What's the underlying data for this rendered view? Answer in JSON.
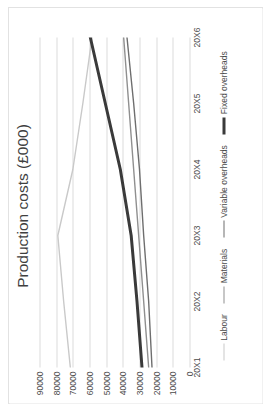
{
  "chart_data": {
    "type": "line",
    "title": "Production costs (£000)",
    "xlabel": "",
    "ylabel": "",
    "categories": [
      "20X1",
      "20X2",
      "20X3",
      "20X4",
      "20X5",
      "20X6"
    ],
    "ylim": [
      0,
      90000
    ],
    "yticks": [
      0,
      10000,
      20000,
      30000,
      40000,
      50000,
      60000,
      70000,
      80000,
      90000
    ],
    "ytick_labels": [
      "0",
      "10000",
      "20000",
      "30000",
      "40000",
      "50000",
      "60000",
      "70000",
      "80000",
      "90000"
    ],
    "grid": "vertical-gridlines-at-y-ticks",
    "legend_position": "bottom",
    "rotation": "chart rotated 90 degrees counter-clockwise",
    "series": [
      {
        "name": "Labour",
        "color": "#c9c9c9",
        "width": 1.4,
        "values": [
          71500,
          75500,
          79000,
          70000,
          64000,
          58500
        ]
      },
      {
        "name": "Materials",
        "color": "#8f8f8f",
        "width": 1.4,
        "values": [
          24500,
          27500,
          30500,
          33500,
          36500,
          39500
        ]
      },
      {
        "name": "Variable overheads",
        "color": "#6e6e6e",
        "width": 1.4,
        "values": [
          22500,
          24500,
          27500,
          30000,
          33500,
          37500
        ]
      },
      {
        "name": "Fixed overheads",
        "color": "#3a3a3a",
        "width": 3.0,
        "values": [
          28500,
          31500,
          35000,
          41500,
          50500,
          59500
        ]
      }
    ]
  },
  "legend": {
    "items": [
      {
        "label": "Labour",
        "color": "#c9c9c9",
        "thickness": "1.6px"
      },
      {
        "label": "Materials",
        "color": "#8f8f8f",
        "thickness": "1.6px"
      },
      {
        "label": "Variable overheads",
        "color": "#6e6e6e",
        "thickness": "1.6px"
      },
      {
        "label": "Fixed overheads",
        "color": "#3a3a3a",
        "thickness": "3px"
      }
    ]
  },
  "colors": {
    "background": "#ffffff",
    "frame_border": "#e2e2e2",
    "gridline": "#dcdcdc",
    "text": "#4a4a4a",
    "title_text": "#3f3f3f"
  }
}
